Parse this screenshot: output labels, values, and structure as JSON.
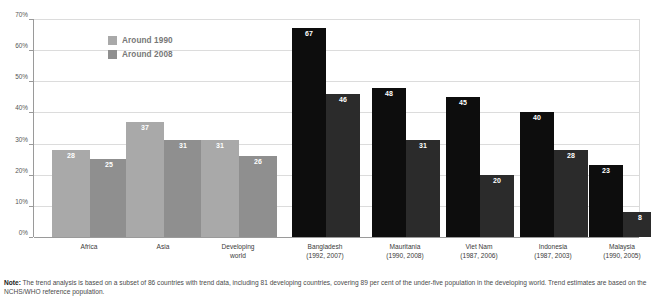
{
  "chart_data": {
    "type": "bar",
    "title": "",
    "xlabel": "",
    "ylabel": "",
    "ylim": [
      0,
      70
    ],
    "ytick_step": 10,
    "ytick_labels": [
      "0%",
      "10%",
      "20%",
      "30%",
      "40%",
      "50%",
      "60%",
      "70%"
    ],
    "grid": true,
    "legend_position": "top-left",
    "series": [
      {
        "name": "Around 1990",
        "color": "#a9a9a9",
        "dark_color": "#0d0d0d",
        "values": [
          28,
          37,
          31,
          67,
          48,
          45,
          40,
          23
        ]
      },
      {
        "name": "Around 2008",
        "color": "#8f8f8f",
        "dark_color": "#2b2b2b",
        "values": [
          25,
          31,
          26,
          46,
          31,
          20,
          28,
          8
        ]
      }
    ],
    "categories": [
      {
        "label": "Africa",
        "years": "",
        "style": "light"
      },
      {
        "label": "Asia",
        "years": "",
        "style": "light"
      },
      {
        "label": "Developing world",
        "label_line1": "Developing",
        "label_line2": "world",
        "years": "",
        "style": "light"
      },
      {
        "label": "Bangladesh",
        "years": "(1992, 2007)",
        "style": "dark"
      },
      {
        "label": "Mauritania",
        "years": "(1990, 2008)",
        "style": "dark"
      },
      {
        "label": "Viet Nam",
        "years": "(1987, 2006)",
        "style": "dark"
      },
      {
        "label": "Indonesia",
        "years": "(1987, 2003)",
        "style": "dark"
      },
      {
        "label": "Malaysia",
        "years": "(1990, 2005)",
        "style": "dark"
      }
    ]
  },
  "legend": {
    "items": [
      {
        "label": "Around 1990",
        "color": "#a9a9a9"
      },
      {
        "label": "Around 2008",
        "color": "#8f8f8f"
      }
    ]
  },
  "note": {
    "prefix": "Note:",
    "text": "The trend analysis is based on a subset of 86 countries with trend data, including 81 developing countries, covering 89 per cent of the under-five population in the developing world. Trend estimates are based on the NCHS/WHO reference population."
  },
  "colors": {
    "grid": "#dcdcdc",
    "axis": "#9a9a9a",
    "bar_light_1990": "#a9a9a9",
    "bar_light_2008": "#8f8f8f",
    "bar_dark_1990": "#0d0d0d",
    "bar_dark_2008": "#2b2b2b",
    "value_label": "#ffffff"
  }
}
